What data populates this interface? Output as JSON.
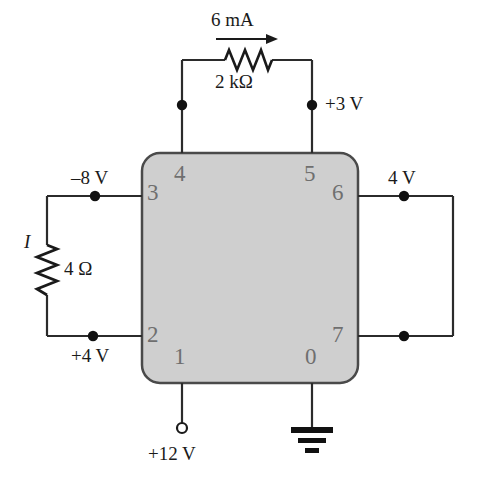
{
  "figure": {
    "kind": "circuit-schematic",
    "title": "",
    "colors": {
      "wire": "#2b2b2b",
      "chip_fill": "#cfcfcf",
      "chip_border": "#4a4a4a",
      "pin_label": "#6f6f6f",
      "text": "#1a1a1a",
      "background": "#ffffff"
    }
  },
  "chip": {
    "name": "integrated-circuit-block",
    "pins": [
      {
        "number": "0",
        "position": "bottom-right"
      },
      {
        "number": "1",
        "position": "bottom-left"
      },
      {
        "number": "2",
        "position": "left-bottom"
      },
      {
        "number": "3",
        "position": "left-top"
      },
      {
        "number": "4",
        "position": "top-left"
      },
      {
        "number": "5",
        "position": "top-right"
      },
      {
        "number": "6",
        "position": "right-top"
      },
      {
        "number": "7",
        "position": "right-bottom"
      }
    ]
  },
  "components": {
    "top_resistor": {
      "value": "2  kΩ",
      "current_label": "6 mA",
      "current_direction": "right"
    },
    "left_resistor": {
      "value": "4 Ω",
      "current_label": "I",
      "orientation": "vertical"
    }
  },
  "node_labels": {
    "pin3_voltage": "–8 V",
    "pin2_voltage": "+4 V",
    "pin5_voltage": "+3 V",
    "pin6_voltage": "4 V",
    "pin1_supply": "+12 V"
  },
  "symbols": {
    "ground": "ground-symbol",
    "supply_terminal": "open-terminal-circle"
  }
}
